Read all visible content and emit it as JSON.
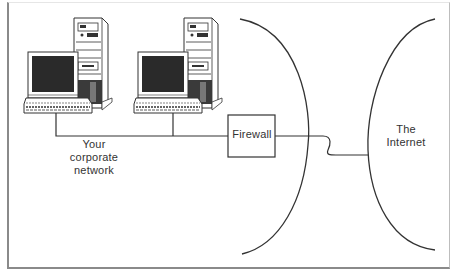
{
  "diagram": {
    "nodes": [
      {
        "id": "pc1",
        "type": "computer",
        "icon": "desktop-computer-icon"
      },
      {
        "id": "pc2",
        "type": "computer",
        "icon": "desktop-computer-icon"
      },
      {
        "id": "firewall",
        "type": "box",
        "label": "Firewall"
      },
      {
        "id": "corporate-network",
        "type": "region",
        "label_lines": [
          "Your",
          "corporate",
          "network"
        ]
      },
      {
        "id": "internet",
        "type": "region",
        "label_lines": [
          "The",
          "Internet"
        ]
      }
    ],
    "edges": [
      {
        "from": "pc1",
        "to": "firewall",
        "style": "straight"
      },
      {
        "from": "pc2",
        "to": "firewall",
        "style": "straight"
      },
      {
        "from": "firewall",
        "to": "internet",
        "style": "wavy"
      }
    ],
    "colors": {
      "line": "#333333",
      "screen": "#2a2a2a",
      "frame": "#8a8a8a"
    }
  },
  "labels": {
    "firewall": "Firewall",
    "corporate": {
      "line1": "Your",
      "line2": "corporate",
      "line3": "network"
    },
    "internet": {
      "line1": "The",
      "line2": "Internet"
    }
  }
}
